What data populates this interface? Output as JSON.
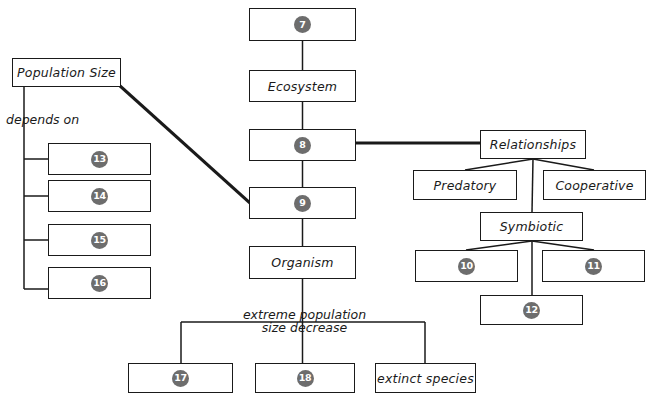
{
  "diagram": {
    "background_color": "#ffffff",
    "line_color": "#1a1a1a",
    "badge_color": "#6d6d6d",
    "badge_text_color": "#ffffff"
  },
  "nodes": {
    "n7": {
      "label": "7",
      "type": "number",
      "x": 249,
      "y": 8,
      "w": 107,
      "h": 33
    },
    "ecosystem": {
      "label": "Ecosystem",
      "type": "text",
      "x": 249,
      "y": 70,
      "w": 107,
      "h": 32
    },
    "n8": {
      "label": "8",
      "type": "number",
      "x": 249,
      "y": 129,
      "w": 107,
      "h": 32
    },
    "n9": {
      "label": "9",
      "type": "number",
      "x": 249,
      "y": 187,
      "w": 107,
      "h": 32
    },
    "organism": {
      "label": "Organism",
      "type": "text",
      "x": 249,
      "y": 246,
      "w": 107,
      "h": 33
    },
    "population_size": {
      "label": "Population Size",
      "type": "text",
      "x": 12,
      "y": 58,
      "w": 109,
      "h": 29
    },
    "n13": {
      "label": "13",
      "type": "number",
      "x": 48,
      "y": 143,
      "w": 103,
      "h": 32
    },
    "n14": {
      "label": "14",
      "type": "number",
      "x": 48,
      "y": 180,
      "w": 103,
      "h": 32
    },
    "n15": {
      "label": "15",
      "type": "number",
      "x": 48,
      "y": 224,
      "w": 103,
      "h": 32
    },
    "n16": {
      "label": "16",
      "type": "number",
      "x": 48,
      "y": 267,
      "w": 103,
      "h": 32
    },
    "relationships": {
      "label": "Relationships",
      "type": "text",
      "x": 480,
      "y": 130,
      "w": 106,
      "h": 29
    },
    "predatory": {
      "label": "Predatory",
      "type": "text",
      "x": 413,
      "y": 170,
      "w": 104,
      "h": 30
    },
    "cooperative": {
      "label": "Cooperative",
      "type": "text",
      "x": 543,
      "y": 170,
      "w": 103,
      "h": 30
    },
    "symbiotic": {
      "label": "Symbiotic",
      "type": "text",
      "x": 480,
      "y": 212,
      "w": 103,
      "h": 29
    },
    "n10": {
      "label": "10",
      "type": "number",
      "x": 415,
      "y": 250,
      "w": 103,
      "h": 32
    },
    "n11": {
      "label": "11",
      "type": "number",
      "x": 542,
      "y": 250,
      "w": 103,
      "h": 32
    },
    "n12": {
      "label": "12",
      "type": "number",
      "x": 480,
      "y": 295,
      "w": 103,
      "h": 30
    },
    "n17": {
      "label": "17",
      "type": "number",
      "x": 128,
      "y": 363,
      "w": 105,
      "h": 30
    },
    "n18": {
      "label": "18",
      "type": "number",
      "x": 255,
      "y": 363,
      "w": 100,
      "h": 30
    },
    "extinct_species": {
      "label": "extinct species",
      "type": "text",
      "x": 375,
      "y": 363,
      "w": 101,
      "h": 30
    }
  },
  "annotations": {
    "depends_on": {
      "text": "depends on",
      "x": 6,
      "y": 112
    },
    "extreme_decrease": {
      "text": "extreme population size\ndecrease",
      "x": 232,
      "y": 308
    }
  }
}
